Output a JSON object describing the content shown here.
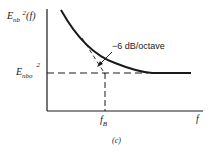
{
  "diagram": {
    "y_label": {
      "base": "E",
      "sub": "nb",
      "sup": "2",
      "suffix": "(f)"
    },
    "floor_label": {
      "base": "E",
      "sub": "nbo",
      "sup": "2"
    },
    "slope_annotation": "−6  dB/octave",
    "x_tick_label": {
      "base": "f",
      "sub": "B"
    },
    "x_axis_label": "f",
    "caption": "(c)"
  }
}
